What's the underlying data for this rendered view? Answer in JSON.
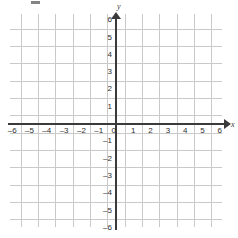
{
  "figure": {
    "kind": "cartesian-coordinate-plane",
    "title": "",
    "background_color": "#ffffff"
  },
  "chart_data": {
    "type": "scatter",
    "title": "",
    "xlabel": "x",
    "ylabel": "y",
    "xlim": [
      -6.5,
      6.5
    ],
    "ylim": [
      -6.5,
      6.5
    ],
    "grid": true,
    "grid_spacing": 1,
    "legend": null,
    "series": [],
    "x": [],
    "y": [],
    "annotations": [],
    "xticks": [
      -6,
      -5,
      -4,
      -3,
      -2,
      -1,
      0,
      1,
      2,
      3,
      4,
      5,
      6
    ],
    "yticks": [
      -6,
      -5,
      -4,
      -3,
      -2,
      -1,
      0,
      1,
      2,
      3,
      4,
      5,
      6
    ],
    "xtick_labels": [
      "–6",
      "–5",
      "–4",
      "–3",
      "–2",
      "–1",
      "0",
      "1",
      "2",
      "3",
      "4",
      "5",
      "6"
    ],
    "ytick_labels": [
      "–6",
      "–5",
      "–4",
      "–3",
      "–2",
      "–1",
      "",
      "1",
      "2",
      "3",
      "4",
      "5",
      "6"
    ]
  },
  "axes": {
    "x_name": "x",
    "y_name": "y",
    "origin_label": "0",
    "axis_color": "#3a3a3a",
    "grid_color": "#c9c9c9",
    "label_color": "#2d2d2d",
    "x_arrow": "arrow-right",
    "y_arrow": "arrow-up"
  },
  "x_tick_labels": [
    {
      "value": -6,
      "text": "–6"
    },
    {
      "value": -5,
      "text": "–5"
    },
    {
      "value": -4,
      "text": "–4"
    },
    {
      "value": -3,
      "text": "–3"
    },
    {
      "value": -2,
      "text": "–2"
    },
    {
      "value": -1,
      "text": "–1"
    },
    {
      "value": 1,
      "text": "1"
    },
    {
      "value": 2,
      "text": "2"
    },
    {
      "value": 3,
      "text": "3"
    },
    {
      "value": 4,
      "text": "4"
    },
    {
      "value": 5,
      "text": "5"
    },
    {
      "value": 6,
      "text": "6"
    }
  ],
  "y_tick_labels": [
    {
      "value": 6,
      "text": "6"
    },
    {
      "value": 5,
      "text": "5"
    },
    {
      "value": 4,
      "text": "4"
    },
    {
      "value": 3,
      "text": "3"
    },
    {
      "value": 2,
      "text": "2"
    },
    {
      "value": 1,
      "text": "1"
    },
    {
      "value": -1,
      "text": "–1"
    },
    {
      "value": -2,
      "text": "–2"
    },
    {
      "value": -3,
      "text": "–3"
    },
    {
      "value": -4,
      "text": "–4"
    },
    {
      "value": -5,
      "text": "–5"
    },
    {
      "value": -6,
      "text": "–6"
    }
  ]
}
